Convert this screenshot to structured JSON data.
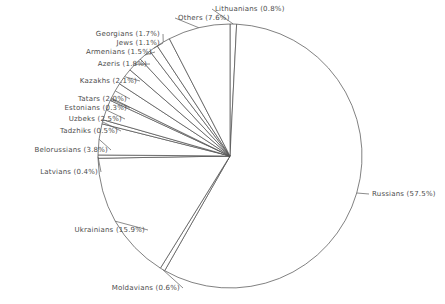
{
  "chart_data": {
    "type": "pie",
    "title": "",
    "subtitle": "",
    "xlabel": "",
    "ylabel": "",
    "legend_position": "none",
    "grid": false,
    "label_format": "{name} ({value}%)",
    "start_angle_deg": 0,
    "direction": "clockwise",
    "categories": [
      "Lithuanians",
      "Russians",
      "Moldavians",
      "Ukrainians",
      "Latvians",
      "Belorussians",
      "Tadzhiks",
      "Uzbeks",
      "Estonians",
      "Tatars",
      "Kazakhs",
      "Azeris",
      "Armenians",
      "Jews",
      "Georgians",
      "Others"
    ],
    "values": [
      0.8,
      57.5,
      0.6,
      15.9,
      0.4,
      3.8,
      0.5,
      2.5,
      0.3,
      2.0,
      2.1,
      1.8,
      1.5,
      1.1,
      1.7,
      7.6
    ],
    "slices": [
      {
        "name": "Lithuanians",
        "value": 0.8,
        "label": "Lithuanians (0.8%)"
      },
      {
        "name": "Russians",
        "value": 57.5,
        "label": "Russians (57.5%)"
      },
      {
        "name": "Moldavians",
        "value": 0.6,
        "label": "Moldavians (0.6%)"
      },
      {
        "name": "Ukrainians",
        "value": 15.9,
        "label": "Ukrainians (15.9%)"
      },
      {
        "name": "Latvians",
        "value": 0.4,
        "label": "Latvians (0.4%)"
      },
      {
        "name": "Belorussians",
        "value": 3.8,
        "label": "Belorussians (3.8%)"
      },
      {
        "name": "Tadzhiks",
        "value": 0.5,
        "label": "Tadzhiks (0.5%)"
      },
      {
        "name": "Uzbeks",
        "value": 2.5,
        "label": "Uzbeks (2.5%)"
      },
      {
        "name": "Estonians",
        "value": 0.3,
        "label": "Estonians (0.3%)"
      },
      {
        "name": "Tatars",
        "value": 2.0,
        "label": "Tatars (2.0%)"
      },
      {
        "name": "Kazakhs",
        "value": 2.1,
        "label": "Kazakhs (2.1%)"
      },
      {
        "name": "Azeris",
        "value": 1.8,
        "label": "Azeris (1.8%)"
      },
      {
        "name": "Armenians",
        "value": 1.5,
        "label": "Armenians (1.5%)"
      },
      {
        "name": "Jews",
        "value": 1.1,
        "label": "Jews (1.1%)"
      },
      {
        "name": "Georgians",
        "value": 1.7,
        "label": "Georgians (1.7%)"
      },
      {
        "name": "Others",
        "value": 7.6,
        "label": "Others (7.6%)"
      }
    ],
    "colors": {
      "slice_fill": "#ffffff",
      "slice_stroke": "#4a4a4a",
      "label_text": "#4c4c4c",
      "background": "#ffffff"
    }
  },
  "geometry": {
    "center_x": 230,
    "center_y": 156,
    "radius": 132
  },
  "labels": [
    {
      "key": "lithuanians",
      "text": "Lithuanians (0.8%)",
      "x": 215,
      "y": 5,
      "align": "left"
    },
    {
      "key": "others",
      "text": "Others (7.6%)",
      "x": 178,
      "y": 14,
      "align": "left"
    },
    {
      "key": "georgians",
      "text": "Georgians (1.7%)",
      "x": 160,
      "y": 30,
      "align": "right"
    },
    {
      "key": "jews",
      "text": "Jews (1.1%)",
      "x": 160,
      "y": 39,
      "align": "right"
    },
    {
      "key": "armenians",
      "text": "Armenians (1.5%)",
      "x": 152,
      "y": 48,
      "align": "right"
    },
    {
      "key": "azeris",
      "text": "Azeris (1.8%)",
      "x": 147,
      "y": 60,
      "align": "right"
    },
    {
      "key": "kazakhs",
      "text": "Kazakhs (2.1%)",
      "x": 137,
      "y": 77,
      "align": "right"
    },
    {
      "key": "tatars",
      "text": "Tatars (2.0%)",
      "x": 127,
      "y": 95,
      "align": "right"
    },
    {
      "key": "estonians",
      "text": "Estonians (0.3%)",
      "x": 127,
      "y": 104,
      "align": "right"
    },
    {
      "key": "uzbeks",
      "text": "Uzbeks (2.5%)",
      "x": 122,
      "y": 115,
      "align": "right"
    },
    {
      "key": "tadzhiks",
      "text": "Tadzhiks (0.5%)",
      "x": 118,
      "y": 127,
      "align": "right"
    },
    {
      "key": "belorussians",
      "text": "Belorussians (3.8%)",
      "x": 108,
      "y": 146,
      "align": "right"
    },
    {
      "key": "latvians",
      "text": "Latvians (0.4%)",
      "x": 98,
      "y": 168,
      "align": "right"
    },
    {
      "key": "ukrainians",
      "text": "Ukrainians (15.9%)",
      "x": 145,
      "y": 226,
      "align": "right"
    },
    {
      "key": "moldavians",
      "text": "Moldavians (0.6%)",
      "x": 180,
      "y": 284,
      "align": "right"
    },
    {
      "key": "russians",
      "text": "Russians (57.5%)",
      "x": 372,
      "y": 190,
      "align": "left"
    }
  ]
}
